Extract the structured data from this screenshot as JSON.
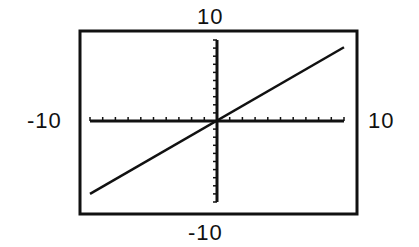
{
  "chart_data": {
    "type": "line",
    "title": "",
    "xlabel": "",
    "ylabel": "",
    "xlim": [
      -10,
      10
    ],
    "ylim": [
      -10,
      10
    ],
    "xscale": 1,
    "yscale": 1,
    "window_labels": {
      "ymax": "10",
      "ymin": "-10",
      "xmin": "-10",
      "xmax": "10"
    },
    "grid": false,
    "axes": {
      "x_ticks_every": 1,
      "y_ticks_every": 1
    },
    "series": [
      {
        "name": "graph",
        "x": [
          -10,
          10
        ],
        "y": [
          -9.0,
          9.1
        ]
      }
    ],
    "colors": {
      "line": "#111111",
      "frame": "#111111",
      "background": "#ffffff"
    }
  },
  "labels": {
    "top": "10",
    "bottom": "-10",
    "left": "-10",
    "right": "10"
  }
}
